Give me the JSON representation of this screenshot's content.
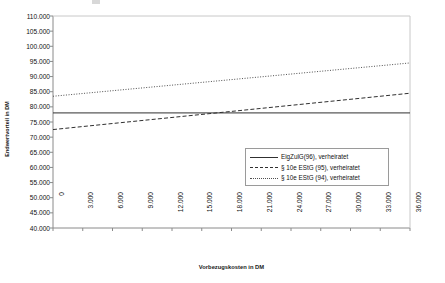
{
  "chart_data": {
    "type": "line",
    "title": "",
    "xlabel": "Vorbezugskosten in DM",
    "ylabel": "Endwertvorteil in DM",
    "xlim": [
      0,
      36000
    ],
    "ylim": [
      40000,
      110000
    ],
    "grid": false,
    "legend_position": "inside-bottom-right",
    "x_tick_labels": [
      "0",
      "3.000",
      "6.000",
      "9.000",
      "12.000",
      "15.000",
      "18.000",
      "21.000",
      "24.000",
      "27.000",
      "30.000",
      "33.000",
      "36.000"
    ],
    "x_tick_values": [
      0,
      3000,
      6000,
      9000,
      12000,
      15000,
      18000,
      21000,
      24000,
      27000,
      30000,
      33000,
      36000
    ],
    "y_tick_labels": [
      "110.000",
      "105.000",
      "100.000",
      "95.000",
      "90.000",
      "85.000",
      "80.000",
      "75.000",
      "70.000",
      "65.000",
      "60.000",
      "55.000",
      "50.000",
      "45.000",
      "40.000"
    ],
    "y_tick_values": [
      110000,
      105000,
      100000,
      95000,
      90000,
      85000,
      80000,
      75000,
      70000,
      65000,
      60000,
      55000,
      50000,
      45000,
      40000
    ],
    "x": [
      0,
      36000
    ],
    "series": [
      {
        "name": "EigZulG(96), verheiratet",
        "style": "solid",
        "color": "#303030",
        "values": [
          78000,
          78000
        ]
      },
      {
        "name": "§ 10e EStG (95), verheiratet",
        "style": "dashed",
        "color": "#303030",
        "values": [
          72500,
          84500
        ]
      },
      {
        "name": "§ 10e EStG (94), verheiratet",
        "style": "dotted",
        "color": "#505050",
        "values": [
          83500,
          94500
        ]
      }
    ]
  },
  "legend": {
    "items": [
      {
        "label": "EigZulG(96), verheiratet",
        "style": "solid"
      },
      {
        "label": "§ 10e EStG (95), verheiratet",
        "style": "dashed"
      },
      {
        "label": "§ 10e EStG (94), verheiratet",
        "style": "dotted"
      }
    ]
  },
  "axes": {
    "x_title": "Vorbezugskosten in DM",
    "y_title": "Endwertvorteil in DM"
  }
}
